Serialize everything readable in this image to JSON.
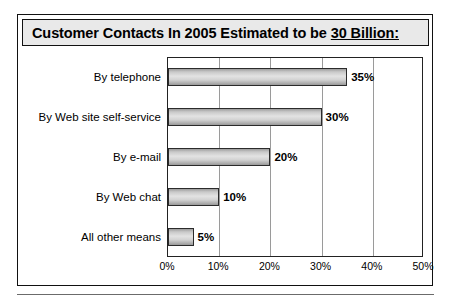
{
  "title": {
    "prefix": "Customer Contacts In 2005 Estimated to be ",
    "underlined": "30 Billion:",
    "full": "Customer Contacts In 2005 Estimated to be 30 Billion:"
  },
  "chart_data": {
    "type": "bar",
    "orientation": "horizontal",
    "title": "Customer Contacts In 2005 Estimated to be 30 Billion:",
    "categories": [
      "By telephone",
      "By Web site self-service",
      "By e-mail",
      "By Web chat",
      "All other means"
    ],
    "values": [
      35,
      30,
      20,
      10,
      5
    ],
    "value_labels": [
      "35%",
      "30%",
      "20%",
      "10%",
      "5%"
    ],
    "xlabel": "",
    "ylabel": "",
    "xlim": [
      0,
      50
    ],
    "xticks": [
      0,
      10,
      20,
      30,
      40,
      50
    ],
    "xtick_labels": [
      "0%",
      "10%",
      "20%",
      "30%",
      "40%",
      "50%"
    ],
    "grid": "vertical",
    "legend": "none",
    "series_name": "Share of customer contacts",
    "bar_color": "#cccccc",
    "bar_border_color": "#2b2b2b",
    "gridline_color": "#9a9a9a",
    "title_background": "#e9e9e9",
    "frame_color": "#111111"
  }
}
